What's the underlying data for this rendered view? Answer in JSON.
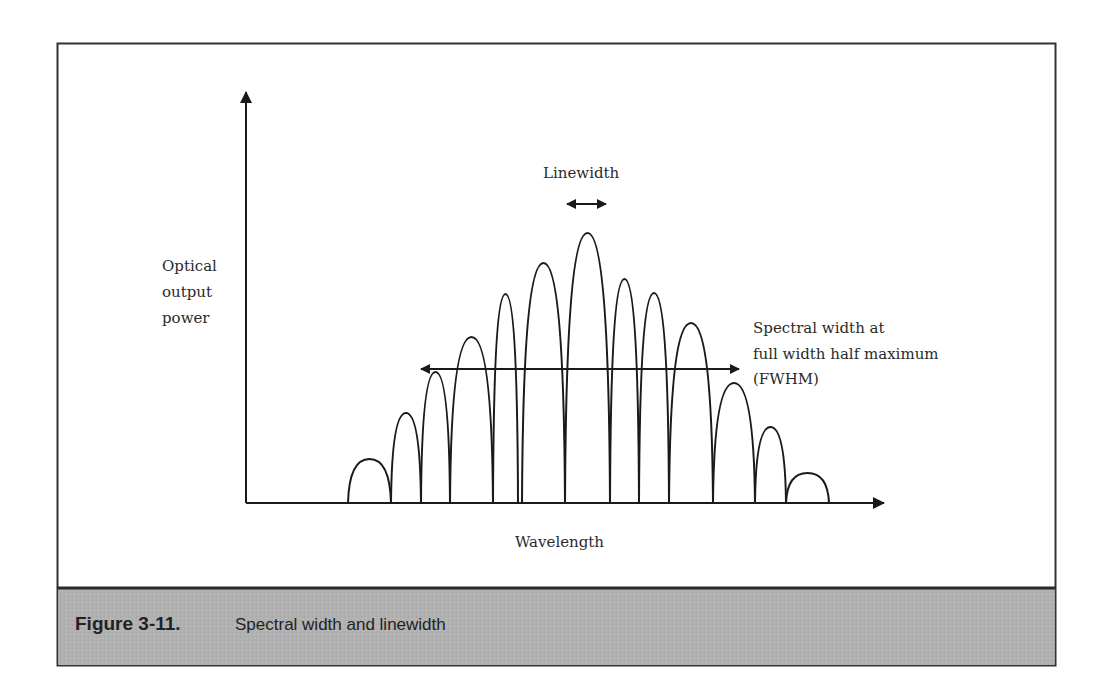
{
  "figure": {
    "number_label": "Figure 3-11.",
    "caption": "Spectral width and linewidth",
    "caption_bar_color": "#b3b3b3",
    "frame_color": "#333333",
    "line_color": "#1a1a1a"
  },
  "axes": {
    "y_label_lines": [
      "Optical",
      "output",
      "power"
    ],
    "x_label": "Wavelength"
  },
  "annotations": {
    "linewidth_label": "Linewidth",
    "fwhm_label_lines": [
      "Spectral width at",
      "full width half maximum",
      "(FWHM)"
    ]
  },
  "chart_data": {
    "type": "diagram",
    "title": "Spectral width and linewidth",
    "xlabel": "Wavelength",
    "ylabel": "Optical output power",
    "modes": [
      {
        "x0": 348,
        "x1": 391,
        "peak_y": 459
      },
      {
        "x0": 391,
        "x1": 421,
        "peak_y": 413
      },
      {
        "x0": 421,
        "x1": 450,
        "peak_y": 372
      },
      {
        "x0": 450,
        "x1": 493,
        "peak_y": 337
      },
      {
        "x0": 493,
        "x1": 518,
        "peak_y": 294
      },
      {
        "x0": 522,
        "x1": 565,
        "peak_y": 263
      },
      {
        "x0": 565,
        "x1": 610,
        "peak_y": 233
      },
      {
        "x0": 610,
        "x1": 639,
        "peak_y": 279
      },
      {
        "x0": 639,
        "x1": 669,
        "peak_y": 293
      },
      {
        "x0": 669,
        "x1": 713,
        "peak_y": 323
      },
      {
        "x0": 713,
        "x1": 755,
        "peak_y": 383
      },
      {
        "x0": 755,
        "x1": 786,
        "peak_y": 427
      },
      {
        "x0": 786,
        "x1": 829,
        "peak_y": 473
      }
    ],
    "relative_mode_heights": [
      0.18,
      0.37,
      0.49,
      0.61,
      0.77,
      0.89,
      1.0,
      0.83,
      0.78,
      0.67,
      0.45,
      0.28,
      0.11
    ],
    "baseline_y": 503,
    "fwhm_arrow": {
      "x_start": 420,
      "x_end": 740,
      "y": 369
    },
    "linewidth_arrow": {
      "x_start": 566,
      "x_end": 607,
      "y": 204
    }
  }
}
